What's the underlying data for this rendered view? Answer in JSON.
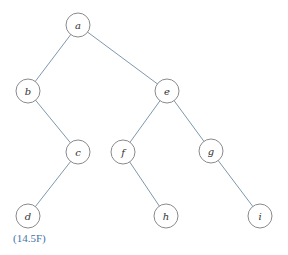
{
  "diagram": {
    "type": "binary-tree",
    "caption": "(14.5F)",
    "colors": {
      "edge": "#7d98ae",
      "node_stroke": "#8a8a8a",
      "caption": "#3f73a8"
    },
    "nodes": [
      {
        "id": "a",
        "label": "a",
        "x": 78,
        "y": 25
      },
      {
        "id": "b",
        "label": "b",
        "x": 28,
        "y": 91
      },
      {
        "id": "e",
        "label": "e",
        "x": 167,
        "y": 91
      },
      {
        "id": "c",
        "label": "c",
        "x": 78,
        "y": 152
      },
      {
        "id": "f",
        "label": "f",
        "x": 123,
        "y": 152
      },
      {
        "id": "g",
        "label": "g",
        "x": 211,
        "y": 151
      },
      {
        "id": "d",
        "label": "d",
        "x": 28,
        "y": 216
      },
      {
        "id": "h",
        "label": "h",
        "x": 166,
        "y": 216
      },
      {
        "id": "i",
        "label": "i",
        "x": 260,
        "y": 216
      }
    ],
    "edges": [
      [
        "a",
        "b"
      ],
      [
        "a",
        "e"
      ],
      [
        "b",
        "c"
      ],
      [
        "c",
        "d"
      ],
      [
        "e",
        "f"
      ],
      [
        "e",
        "g"
      ],
      [
        "f",
        "h"
      ],
      [
        "g",
        "i"
      ]
    ]
  }
}
